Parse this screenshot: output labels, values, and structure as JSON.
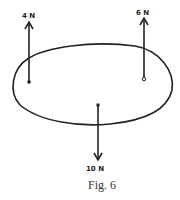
{
  "figure": {
    "caption": "Fig. 6",
    "forces": [
      {
        "label": "4 N",
        "direction": "up"
      },
      {
        "label": "6 N",
        "direction": "up"
      },
      {
        "label": "10 N",
        "direction": "down"
      }
    ],
    "stroke_color": "#222222"
  }
}
